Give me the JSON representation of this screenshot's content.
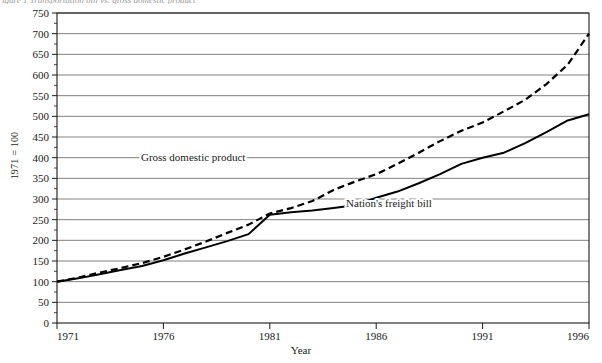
{
  "caption": {
    "text": "igure 1  Transportation bill vs. gross domestic product"
  },
  "chart_data": {
    "type": "line",
    "title": "",
    "xlabel": "Year",
    "ylabel": "1971 = 100",
    "x": [
      1971,
      1972,
      1973,
      1974,
      1975,
      1976,
      1977,
      1978,
      1979,
      1980,
      1981,
      1982,
      1983,
      1984,
      1985,
      1986,
      1987,
      1988,
      1989,
      1990,
      1991,
      1992,
      1993,
      1994,
      1995,
      1996
    ],
    "xlim": [
      1971,
      1996
    ],
    "ylim": [
      0,
      750
    ],
    "ytick_step": 50,
    "xticks": [
      1971,
      1976,
      1981,
      1986,
      1991,
      1996
    ],
    "yticks": [
      0,
      50,
      100,
      150,
      200,
      250,
      300,
      350,
      400,
      450,
      500,
      550,
      600,
      650,
      700,
      750
    ],
    "grid": true,
    "grid_axis": "y",
    "legend": "inline-annotations",
    "series": [
      {
        "name": "Gross domestic product",
        "style": "dashed",
        "color": "#000000",
        "label_x": 1977.4,
        "label_y": 392,
        "values": [
          100,
          110,
          122,
          133,
          145,
          160,
          178,
          197,
          218,
          238,
          265,
          278,
          295,
          322,
          342,
          360,
          385,
          412,
          440,
          465,
          485,
          512,
          540,
          578,
          625,
          700
        ]
      },
      {
        "name": "Nation's freight bill",
        "style": "solid",
        "color": "#000000",
        "label_x": 1986.6,
        "label_y": 281,
        "values": [
          100,
          108,
          118,
          128,
          138,
          152,
          168,
          183,
          198,
          215,
          262,
          268,
          272,
          278,
          285,
          303,
          318,
          338,
          360,
          385,
          400,
          412,
          435,
          462,
          490,
          505
        ]
      }
    ]
  }
}
